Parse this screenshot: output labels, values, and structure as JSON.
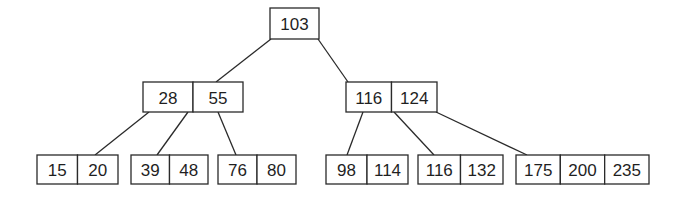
{
  "diagram": {
    "type": "b-tree",
    "root": {
      "id": "n-root",
      "keys": [
        "103"
      ],
      "children": [
        {
          "id": "n-l",
          "keys": [
            "28",
            "55"
          ],
          "children": [
            {
              "id": "n-ll",
              "keys": [
                "15",
                "20"
              ],
              "children": []
            },
            {
              "id": "n-lm",
              "keys": [
                "39",
                "48"
              ],
              "children": []
            },
            {
              "id": "n-lr",
              "keys": [
                "76",
                "80"
              ],
              "children": []
            }
          ]
        },
        {
          "id": "n-r",
          "keys": [
            "116",
            "124"
          ],
          "children": [
            {
              "id": "n-rl",
              "keys": [
                "98",
                "114"
              ],
              "children": []
            },
            {
              "id": "n-rm",
              "keys": [
                "116",
                "132"
              ],
              "children": []
            },
            {
              "id": "n-rr",
              "keys": [
                "175",
                "200",
                "235"
              ],
              "children": []
            }
          ]
        }
      ]
    }
  }
}
